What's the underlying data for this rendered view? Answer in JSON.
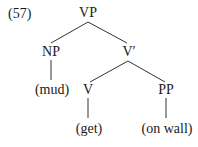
{
  "example_number": "(57)",
  "tree": {
    "root": "VP",
    "np": "NP",
    "np_leaf": "(mud)",
    "vbar": "V′",
    "v": "V",
    "v_leaf": "(get)",
    "pp": "PP",
    "pp_leaf": "(on wall)"
  },
  "colors": {
    "ink": "#1a1a1a",
    "edge": "#333333",
    "background": "#ffffff"
  }
}
